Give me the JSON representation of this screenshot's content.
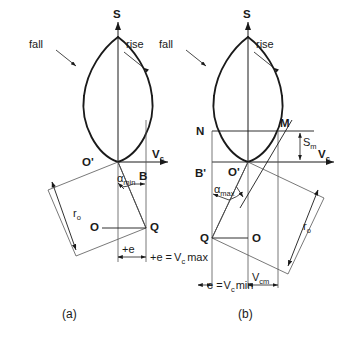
{
  "figure": {
    "type": "engineering-diagram",
    "panels": [
      {
        "id": "a",
        "caption": "(a)",
        "axes": {
          "vertical": "S",
          "horizontal": "V",
          "horizontal_sub": "c"
        },
        "curve_labels": {
          "fall": "fall",
          "rise": "rise"
        },
        "points": {
          "origin": "O'",
          "b": "B",
          "o": "O",
          "q": "Q"
        },
        "angle": {
          "symbol": "α",
          "sub": "min"
        },
        "radius": {
          "symbol": "r",
          "sub": "o"
        },
        "dims": {
          "offset": "+e",
          "max": "+e =",
          "max_v": "V",
          "max_sub": "c",
          "max_tail": "max"
        }
      },
      {
        "id": "b",
        "caption": "(b)",
        "axes": {
          "vertical": "S",
          "horizontal": "V",
          "horizontal_sub": "c"
        },
        "curve_labels": {
          "fall": "fall",
          "rise": "rise"
        },
        "points": {
          "origin": "O'",
          "n": "N",
          "m": "M",
          "bprime": "B'",
          "o": "O",
          "q": "Q"
        },
        "angle": {
          "symbol": "α",
          "sub": "max"
        },
        "radius": {
          "symbol": "r",
          "sub": "o"
        },
        "stroke": {
          "symbol": "S",
          "sub": "m"
        },
        "dims": {
          "min": "e =",
          "min_v": "V",
          "min_sub": "c",
          "min_tail": "min",
          "vcm": "V",
          "vcm_sub": "cm"
        }
      }
    ],
    "colors": {
      "ink": "#1a1a1a",
      "thin": "#555555",
      "background": "#ffffff"
    }
  }
}
